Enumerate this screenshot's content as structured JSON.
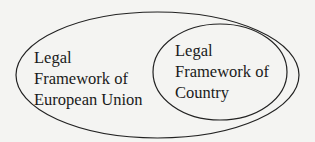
{
  "diagram": {
    "type": "nested-ellipses",
    "outer": {
      "lines": [
        "Legal",
        "Framework of",
        "European Union"
      ]
    },
    "inner": {
      "lines": [
        "Legal",
        "Framework of",
        "Country"
      ]
    },
    "stroke_color": "#222222",
    "background_color": "#f4f4f2"
  }
}
